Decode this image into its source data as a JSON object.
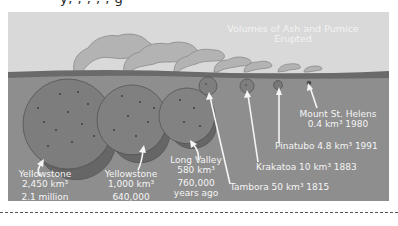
{
  "figure": {
    "title": "Volumes of Ash and Pumice Erupted",
    "title_lines": [
      "Volumes of Ash and Pumice",
      "Erupted"
    ],
    "top_cut_text": "y, , , , , g",
    "colors": {
      "sky": "#d9d9d9",
      "ground": "#8e8e8e",
      "ground_line": "#6a6a6a",
      "sphere": "#7d7d7d",
      "sphere_shadow": "#626262",
      "plume": "#b5b5b5",
      "text": "#f5f5f5"
    }
  },
  "eruptions": [
    {
      "name": "Yellowstone",
      "volume": "2,450 km³",
      "when_line1": "2.1 million",
      "when_line2": "years ago"
    },
    {
      "name": "Yellowstone",
      "volume": "1,000 km³",
      "when_line1": "640,000",
      "when_line2": "years ago"
    },
    {
      "name": "Long Valley",
      "volume": "580 km³",
      "when_line1": "760,000",
      "when_line2": "years ago"
    },
    {
      "name": "Tambora",
      "label": "Tambora 50 km³ 1815"
    },
    {
      "name": "Krakatoa",
      "label": "Krakatoa 10 km³ 1883"
    },
    {
      "name": "Pinatubo",
      "label": "Pinatubo 4.8 km³ 1991"
    },
    {
      "name": "Mount St. Helens",
      "line1": "Mount St. Helens",
      "line2": "0.4 km³ 1980"
    }
  ]
}
